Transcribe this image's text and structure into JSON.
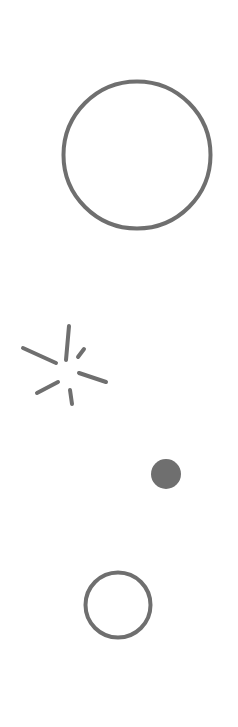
{
  "canvas": {
    "width": 238,
    "height": 727,
    "background": "#ffffff"
  },
  "colors": {
    "stroke": "#6f6f6f",
    "fill": "#6f6f6f"
  },
  "shapes": {
    "large_circle": {
      "icon": "circle-outline-icon",
      "cx": 137,
      "cy": 155,
      "r": 73.5,
      "stroke_width": 4
    },
    "burst": {
      "icon": "sparkle-burst-icon",
      "stroke_width": 4,
      "rays": [
        {
          "x1": 23,
          "y1": 348,
          "x2": 56,
          "y2": 363
        },
        {
          "x1": 69,
          "y1": 326,
          "x2": 66,
          "y2": 360
        },
        {
          "x1": 84,
          "y1": 349,
          "x2": 78,
          "y2": 357
        },
        {
          "x1": 79,
          "y1": 373,
          "x2": 106,
          "y2": 382
        },
        {
          "x1": 37,
          "y1": 393,
          "x2": 58,
          "y2": 382
        },
        {
          "x1": 70,
          "y1": 390,
          "x2": 72,
          "y2": 404
        }
      ]
    },
    "filled_dot": {
      "icon": "filled-dot-icon",
      "cx": 166,
      "cy": 474,
      "r": 15
    },
    "small_ring": {
      "icon": "ring-icon",
      "cx": 118,
      "cy": 605,
      "r": 32.5,
      "stroke_width": 4
    }
  }
}
